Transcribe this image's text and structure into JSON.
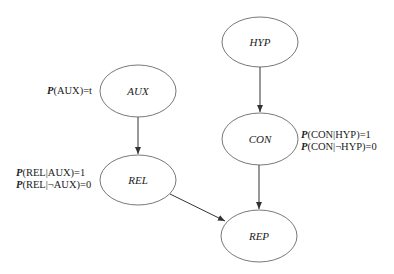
{
  "diagram": {
    "type": "bayesian-network",
    "nodes": [
      {
        "id": "HYP",
        "label": "HYP",
        "cx": 260,
        "cy": 42
      },
      {
        "id": "AUX",
        "label": "AUX",
        "cx": 138,
        "cy": 91
      },
      {
        "id": "CON",
        "label": "CON",
        "cx": 260,
        "cy": 139
      },
      {
        "id": "REL",
        "label": "REL",
        "cx": 138,
        "cy": 180
      },
      {
        "id": "REP",
        "label": "REP",
        "cx": 259,
        "cy": 236
      }
    ],
    "edges": [
      {
        "from": "HYP",
        "to": "CON"
      },
      {
        "from": "AUX",
        "to": "REL"
      },
      {
        "from": "CON",
        "to": "REP"
      },
      {
        "from": "REL",
        "to": "REP"
      }
    ],
    "annotations": {
      "aux": {
        "p": "P",
        "text": "(AUX)=t"
      },
      "rel": [
        {
          "p": "P",
          "text": "(REL|AUX)=1"
        },
        {
          "p": "P",
          "text": "(REL|¬AUX)=0"
        }
      ],
      "con": [
        {
          "p": "P",
          "text": "(CON|HYP)=1"
        },
        {
          "p": "P",
          "text": "(CON|¬HYP)=0"
        }
      ]
    },
    "colors": {
      "stroke": "#555555",
      "arrow": "#333333",
      "text": "#222222"
    }
  }
}
